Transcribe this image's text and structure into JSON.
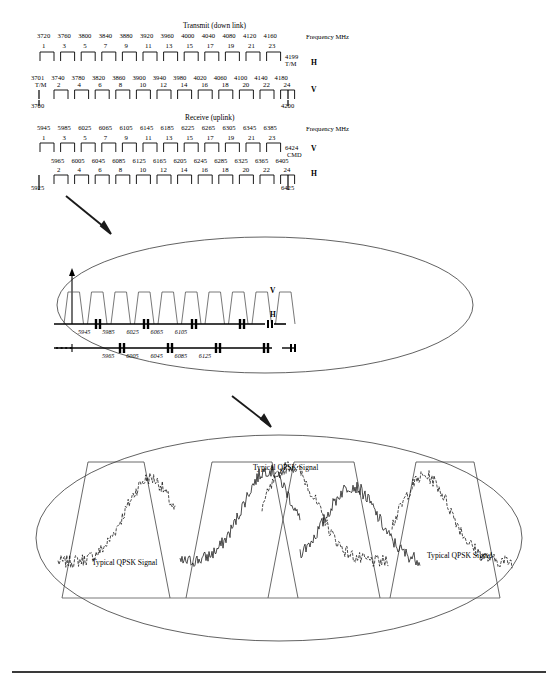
{
  "figure": {
    "title_transmit": "Transmit (down link)",
    "title_receive": "Receive (uplink)",
    "axis_unit_label": "Frequency MHz"
  },
  "transmit": {
    "h_row": {
      "polarization": "H",
      "frequencies": [
        "3720",
        "3760",
        "3800",
        "3840",
        "3880",
        "3920",
        "3960",
        "4000",
        "4040",
        "4080",
        "4120",
        "4160"
      ],
      "channels": [
        "1",
        "3",
        "5",
        "7",
        "9",
        "11",
        "13",
        "15",
        "17",
        "19",
        "21",
        "23"
      ],
      "right_end_value": "4199",
      "right_end_note": "T/M"
    },
    "v_row": {
      "polarization": "V",
      "frequencies": [
        "3701",
        "3740",
        "3780",
        "3820",
        "3860",
        "3900",
        "3940",
        "3980",
        "4020",
        "4060",
        "4100",
        "4140",
        "4180"
      ],
      "left_note": "T/M",
      "channels": [
        "2",
        "4",
        "6",
        "8",
        "10",
        "12",
        "14",
        "16",
        "18",
        "20",
        "22",
        "24"
      ],
      "left_end_value": "3700",
      "right_end_value": "4200"
    }
  },
  "receive": {
    "v_row": {
      "polarization": "V",
      "frequencies": [
        "5945",
        "5985",
        "6025",
        "6065",
        "6105",
        "6145",
        "6185",
        "6225",
        "6265",
        "6305",
        "6345",
        "6385"
      ],
      "channels": [
        "1",
        "3",
        "5",
        "7",
        "9",
        "11",
        "13",
        "15",
        "17",
        "19",
        "21",
        "23"
      ],
      "right_end_value": "6424",
      "right_end_note": "CMD"
    },
    "h_row": {
      "polarization": "H",
      "frequencies": [
        "5965",
        "6005",
        "6045",
        "6085",
        "6125",
        "6165",
        "6205",
        "6245",
        "6285",
        "6325",
        "6365",
        "6405"
      ],
      "channels": [
        "2",
        "4",
        "6",
        "8",
        "10",
        "12",
        "14",
        "16",
        "18",
        "20",
        "22",
        "24"
      ],
      "left_end_value": "5925",
      "right_end_value": "6425"
    }
  },
  "detail_middle": {
    "v_label": "V",
    "h_label": "H",
    "v_axis_ticks": [
      "5945",
      "5985",
      "6025",
      "6065",
      "6105"
    ],
    "h_axis_ticks": [
      "5965",
      "6005",
      "6045",
      "6085",
      "6125"
    ]
  },
  "detail_bottom": {
    "labels": [
      "Typical QPSK Signal",
      "Typical QPSK Signal",
      "Typical QPSK Signal"
    ]
  },
  "colors": {
    "ink": "#000000",
    "rule": "#3a3a3a",
    "thin": "#555555"
  },
  "chart_data": {
    "type": "table",
    "xlabel": "Frequency MHz",
    "series": [
      {
        "name": "Transmit H (odd channels)",
        "x": [
          3720,
          3760,
          3800,
          3840,
          3880,
          3920,
          3960,
          4000,
          4040,
          4080,
          4120,
          4160
        ],
        "labels": [
          1,
          3,
          5,
          7,
          9,
          11,
          13,
          15,
          17,
          19,
          21,
          23
        ],
        "end": 4199
      },
      {
        "name": "Transmit V (even channels)",
        "x": [
          3740,
          3780,
          3820,
          3860,
          3900,
          3940,
          3980,
          4020,
          4060,
          4100,
          4140,
          4180
        ],
        "labels": [
          2,
          4,
          6,
          8,
          10,
          12,
          14,
          16,
          18,
          20,
          22,
          24
        ],
        "start": 3700,
        "end": 4200
      },
      {
        "name": "Receive V (odd channels)",
        "x": [
          5945,
          5985,
          6025,
          6065,
          6105,
          6145,
          6185,
          6225,
          6265,
          6305,
          6345,
          6385
        ],
        "labels": [
          1,
          3,
          5,
          7,
          9,
          11,
          13,
          15,
          17,
          19,
          21,
          23
        ],
        "end": 6424
      },
      {
        "name": "Receive H (even channels)",
        "x": [
          5965,
          6005,
          6045,
          6085,
          6125,
          6165,
          6205,
          6245,
          6285,
          6325,
          6365,
          6405
        ],
        "labels": [
          2,
          4,
          6,
          8,
          10,
          12,
          14,
          16,
          18,
          20,
          22,
          24
        ],
        "start": 5925,
        "end": 6425
      }
    ]
  }
}
